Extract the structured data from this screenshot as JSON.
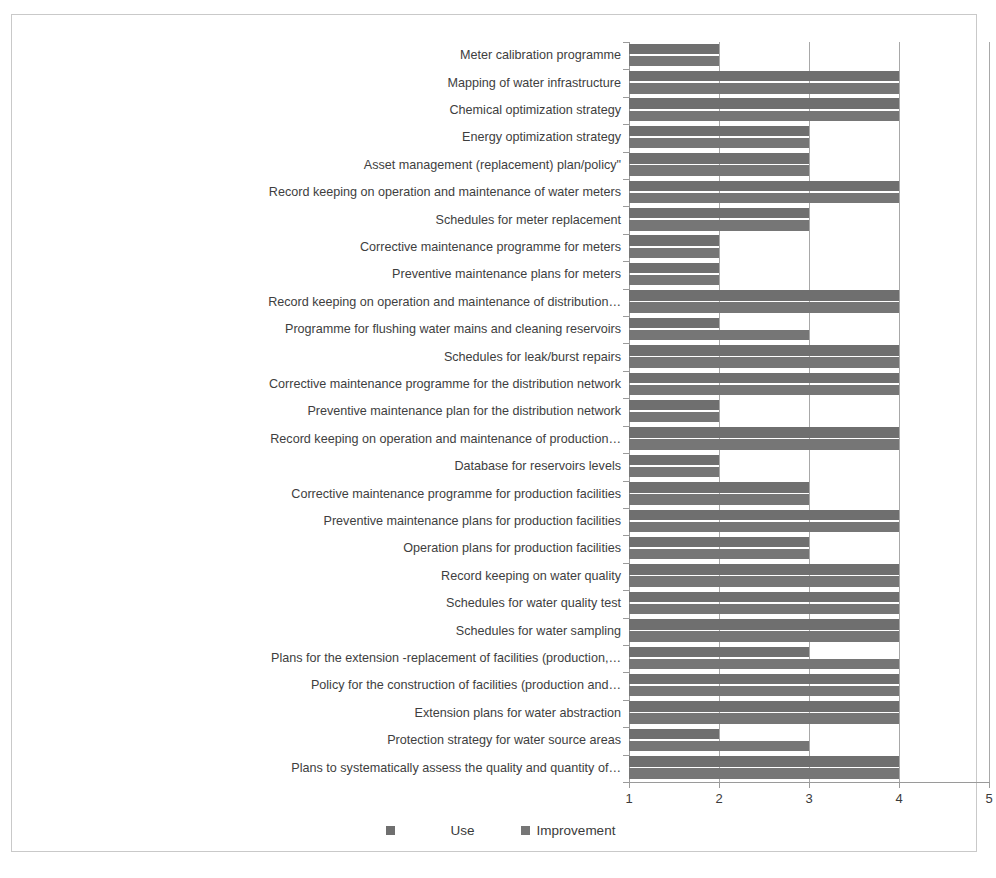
{
  "chart_data": {
    "type": "bar",
    "orientation": "horizontal",
    "title": "",
    "subtitle": "",
    "xlabel": "",
    "ylabel": "",
    "xlim": [
      1,
      5
    ],
    "xticks": [
      1,
      2,
      3,
      4,
      5
    ],
    "xtick_labels": [
      "1",
      "2",
      "3",
      "4",
      "5"
    ],
    "grid": true,
    "grid_axis": "x",
    "legend_position": "bottom",
    "colors": {
      "use": "#6f6f6f",
      "improvement": "#767676",
      "gridline": "#a8a8a8",
      "axis": "#9a9a9a",
      "frame_border": "#c9c9c9",
      "text": "#3a3a3a",
      "background": "#ffffff"
    },
    "categories": [
      "Meter calibration programme",
      "Mapping of water infrastructure",
      "Chemical optimization strategy",
      "Energy optimization strategy",
      "Asset management (replacement) plan/policy\"",
      "Record keeping on operation and maintenance of water meters",
      "Schedules for meter replacement",
      "Corrective maintenance programme for meters",
      "Preventive maintenance plans for meters",
      "Record keeping on operation and maintenance of distribution…",
      "Programme for flushing water mains and cleaning reservoirs",
      "Schedules for leak/burst repairs",
      "Corrective maintenance programme for the distribution network",
      "Preventive  maintenance plan for the distribution network",
      "Record keeping on operation and maintenance of production…",
      "Database for reservoirs levels",
      "Corrective maintenance programme for  production facilities",
      "Preventive maintenance plans for production facilities",
      "Operation plans for production facilities",
      "Record keeping on water quality",
      "Schedules for water quality test",
      "Schedules for water sampling",
      "Plans for the extension -replacement of facilities (production,…",
      "Policy for the construction of facilities (production and…",
      "Extension plans for water abstraction",
      "Protection strategy for water source areas",
      "Plans to systematically assess the  quality and quantity of…"
    ],
    "series": [
      {
        "name": "Use",
        "color": "#6f6f6f",
        "values": [
          2,
          4,
          4,
          3,
          3,
          4,
          3,
          2,
          2,
          4,
          2,
          4,
          4,
          2,
          4,
          2,
          3,
          4,
          3,
          4,
          4,
          4,
          3,
          4,
          4,
          2,
          4
        ]
      },
      {
        "name": "Improvement",
        "color": "#767676",
        "values": [
          2,
          4,
          4,
          3,
          3,
          4,
          3,
          2,
          2,
          4,
          3,
          4,
          4,
          2,
          4,
          2,
          3,
          4,
          3,
          4,
          4,
          4,
          4,
          4,
          4,
          3,
          4
        ]
      }
    ]
  },
  "legend": {
    "items": [
      {
        "label": "Use",
        "color": "#6f6f6f"
      },
      {
        "label": "Improvement",
        "color": "#767676"
      }
    ]
  }
}
